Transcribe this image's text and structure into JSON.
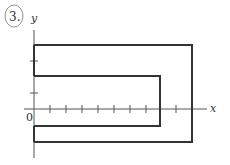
{
  "problem_number": "3.",
  "axes": {
    "x_label": "x",
    "y_label": "y",
    "origin_label": "0"
  },
  "colors": {
    "stroke": "#333333",
    "background": "#ffffff"
  }
}
